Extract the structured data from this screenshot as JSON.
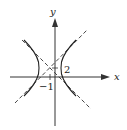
{
  "diagram": {
    "type": "hyperbola-graph",
    "axes": {
      "x_label": "x",
      "y_label": "y"
    },
    "tick_labels": {
      "x_tick": "−1",
      "y_tick": "2"
    },
    "center": {
      "x": -1,
      "y": 2
    },
    "orientation": "horizontal-transverse-axis",
    "asymptotes": 2,
    "colors": {
      "curve": "#222222",
      "axis": "#333333",
      "background": "#ffffff"
    }
  }
}
